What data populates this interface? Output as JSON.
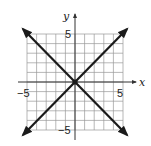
{
  "chart_data": {
    "type": "line",
    "title": "",
    "xlabel": "x",
    "ylabel": "y",
    "xlim": [
      -5,
      5
    ],
    "ylim": [
      -5,
      5
    ],
    "grid": true,
    "grid_step": 1,
    "tick_labels": {
      "x": [
        "-5",
        "5"
      ],
      "y": [
        "5",
        "-5"
      ]
    },
    "series": [
      {
        "name": "y = x",
        "x": [
          -5,
          5
        ],
        "y": [
          -5,
          5
        ],
        "arrows": "both"
      },
      {
        "name": "y = -x",
        "x": [
          -5,
          5
        ],
        "y": [
          5,
          -5
        ],
        "arrows": "both"
      }
    ],
    "points": [
      {
        "x": 0,
        "y": 0,
        "label": ""
      }
    ],
    "legend": "none"
  },
  "labels": {
    "x_axis": "x",
    "y_axis": "y",
    "x_neg": "−5",
    "x_pos": "5",
    "y_pos": "5",
    "y_neg": "−5"
  },
  "colors": {
    "grid": "#9a9a9a",
    "axes": "#333333",
    "lines": "#1a1a1a",
    "background": "#ffffff"
  }
}
